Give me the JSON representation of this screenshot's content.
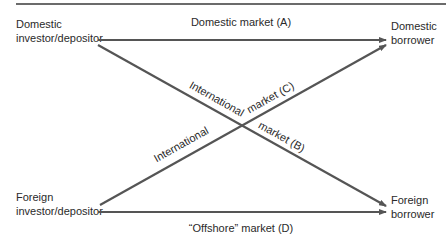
{
  "diagram": {
    "nodes": {
      "domestic_investor": {
        "line1": "Domestic",
        "line2": "investor/depositor"
      },
      "foreign_investor": {
        "line1": "Foreign",
        "line2": "investor/depositor"
      },
      "domestic_borrower": {
        "line1": "Domestic",
        "line2": "borrower"
      },
      "foreign_borrower": {
        "line1": "Foreign",
        "line2": "borrower"
      }
    },
    "edges": {
      "a": {
        "label": "Domestic market (A)",
        "from": "domestic_investor",
        "to": "domestic_borrower"
      },
      "b": {
        "label_part1": "International",
        "label_part2": "market (B)",
        "from": "domestic_investor",
        "to": "foreign_borrower"
      },
      "c": {
        "label_part1": "International",
        "label_part2": "market (C)",
        "from": "foreign_investor",
        "to": "domestic_borrower"
      },
      "d": {
        "label": "“Offshore” market (D)",
        "from": "foreign_investor",
        "to": "foreign_borrower"
      }
    },
    "colors": {
      "line": "#555555",
      "text": "#2a2a2a",
      "rule": "#6b6b6b"
    }
  }
}
